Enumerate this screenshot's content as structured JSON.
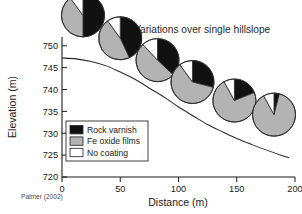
{
  "chart_data": {
    "type": "pie",
    "title": "Variations over single hillslope",
    "xlabel": "Distance (m)",
    "ylabel": "Elevation (m)",
    "xlim": [
      0,
      200
    ],
    "ylim": [
      720,
      752
    ],
    "xticks": [
      0,
      50,
      100,
      150,
      200
    ],
    "yticks": [
      720,
      725,
      730,
      735,
      740,
      745,
      750
    ],
    "grid": false,
    "credit": "Palmer (2002)",
    "legend_position": "inside-lower-left",
    "categories": [
      "Rock varnish",
      "Fe oxide films",
      "No coating"
    ],
    "category_colors": [
      "#111111",
      "#b3b3b3",
      "#ffffff"
    ],
    "pies": [
      {
        "distance": 18,
        "elevation": 751,
        "values": [
          50,
          40,
          10
        ]
      },
      {
        "distance": 50,
        "elevation": 746,
        "values": [
          43,
          47,
          10
        ]
      },
      {
        "distance": 82,
        "elevation": 741,
        "values": [
          37,
          51,
          12
        ]
      },
      {
        "distance": 112,
        "elevation": 736,
        "values": [
          29,
          61,
          10
        ]
      },
      {
        "distance": 148,
        "elevation": 732,
        "values": [
          19,
          73,
          8
        ]
      },
      {
        "distance": 182,
        "elevation": 729,
        "values": [
          4,
          88,
          8
        ]
      }
    ],
    "slope_profile": {
      "xlabel_note": "hillslope surface profile",
      "x": [
        0,
        12,
        25,
        38,
        50,
        63,
        75,
        88,
        100,
        113,
        125,
        138,
        150,
        163,
        175,
        188,
        195
      ],
      "y": [
        747.2,
        747.0,
        746.4,
        745.4,
        744.0,
        742.3,
        740.3,
        738.2,
        736.0,
        733.9,
        732.0,
        730.3,
        728.8,
        727.4,
        726.2,
        725.0,
        724.4
      ]
    }
  },
  "legend": {
    "items": [
      {
        "label": "Rock varnish",
        "color": "#111111"
      },
      {
        "label": "Fe oxide films",
        "color": "#b3b3b3"
      },
      {
        "label": "No coating",
        "color": "#ffffff"
      }
    ]
  },
  "axes": {
    "x_title": "Distance (m)",
    "y_title": "Elevation (m)",
    "x_tick_labels": [
      "0",
      "50",
      "100",
      "150",
      "200"
    ],
    "y_tick_labels": [
      "720",
      "725",
      "730",
      "735",
      "740",
      "745",
      "750"
    ]
  },
  "header": {
    "title": "Variations over single hillslope"
  },
  "footer": {
    "credit": "Palmer (2002)"
  }
}
